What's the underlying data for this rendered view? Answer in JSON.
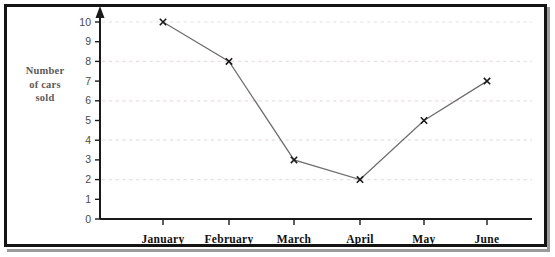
{
  "chart_data": {
    "type": "line",
    "title": "",
    "xlabel": "",
    "ylabel": "Number of cars sold",
    "ylabel_lines": [
      "Number",
      "of cars",
      "sold"
    ],
    "categories": [
      "January",
      "February",
      "March",
      "April",
      "May",
      "June"
    ],
    "values": [
      10,
      8,
      3,
      2,
      5,
      7
    ],
    "series": [
      {
        "name": "Number of cars sold",
        "values": [
          10,
          8,
          3,
          2,
          5,
          7
        ]
      }
    ],
    "ylim": [
      0,
      10
    ],
    "ytick_labels": [
      "0",
      "1",
      "2",
      "3",
      "4",
      "5",
      "6",
      "7",
      "8",
      "9",
      "10"
    ],
    "ytick_values": [
      0,
      1,
      2,
      3,
      4,
      5,
      6,
      7,
      8,
      9,
      10
    ],
    "gridlines": {
      "horizontal_at": [
        2,
        4,
        6,
        8,
        10
      ],
      "style": "dotted",
      "color": "#e8dede",
      "vertical": false
    },
    "marker": "x-cross",
    "legend": "none",
    "axis_arrow_y": true,
    "colors": {
      "line": "#6f6f6f",
      "marker": "#1a1a1a",
      "axis": "#1a1a1a",
      "grid": "#e8dede",
      "ylabel_text": "#5e5a5a",
      "xlabel_text": "#111111",
      "ytick_text": "#4a4a4a",
      "frame": "#141414",
      "background": "#ffffff"
    }
  }
}
